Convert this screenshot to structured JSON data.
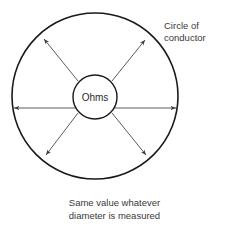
{
  "figure": {
    "center_label": "Ohms",
    "annotation": {
      "line1": "Circle of",
      "line2": "conductor"
    },
    "caption": {
      "line1": "Same value whatever",
      "line2": "diameter is measured"
    }
  },
  "colors": {
    "stroke": "#1a1a1a",
    "arrow": "#4a4a4a",
    "text": "#3a3a3a",
    "background": "#ffffff"
  },
  "geometry": {
    "outer_circle": {
      "cx": 95,
      "cy": 96,
      "r": 83
    },
    "inner_circle": {
      "cx": 95,
      "cy": 97,
      "r": 22
    },
    "diameter_count": 3,
    "diameter_angles_deg": [
      0,
      40,
      140
    ]
  }
}
